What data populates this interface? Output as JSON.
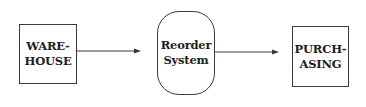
{
  "diagram": {
    "type": "flowchart",
    "nodes": [
      {
        "id": "warehouse",
        "label": "WARE-\nHOUSE",
        "shape": "rectangle"
      },
      {
        "id": "reorder",
        "label": "Reorder\nSystem",
        "shape": "rounded-rectangle"
      },
      {
        "id": "purchasing",
        "label": "PURCH-\nASING",
        "shape": "rectangle"
      }
    ],
    "edges": [
      {
        "from": "warehouse",
        "to": "reorder",
        "style": "arrow"
      },
      {
        "from": "reorder",
        "to": "purchasing",
        "style": "arrow"
      }
    ],
    "colors": {
      "stroke": "#3a3a3a",
      "text": "#1e1e1e",
      "background": "#ffffff"
    }
  }
}
